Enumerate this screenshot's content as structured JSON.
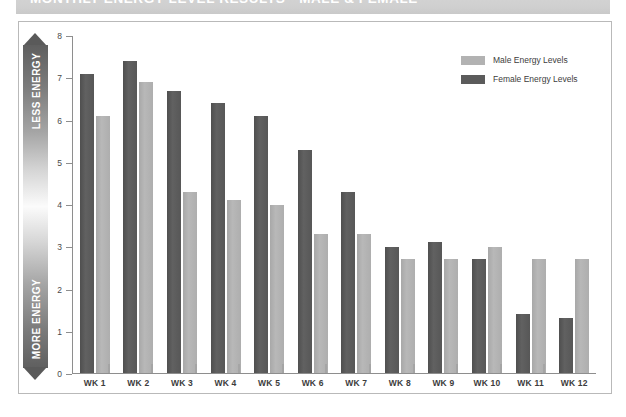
{
  "header": {
    "title": "MONTHLY ENERGY LEVEL RESULTS - MALE & FEMALE"
  },
  "energy_axis": {
    "top_label": "LESS ENERGY",
    "bottom_label": "MORE ENERGY"
  },
  "legend": {
    "items": [
      {
        "label": "Male Energy Levels",
        "color": "#b2b2b2",
        "key": "male"
      },
      {
        "label": "Female Energy Levels",
        "color": "#5b5b5b",
        "key": "female"
      }
    ]
  },
  "y_axis": {
    "ticks": [
      "0",
      "1",
      "2",
      "3",
      "4",
      "5",
      "6",
      "7",
      "8"
    ]
  },
  "chart_data": {
    "type": "bar",
    "title": "MONTHLY ENERGY LEVEL RESULTS - MALE & FEMALE",
    "xlabel": "",
    "ylabel": "",
    "ylim": [
      0,
      8
    ],
    "yticks": [
      0,
      1,
      2,
      3,
      4,
      5,
      6,
      7,
      8
    ],
    "grid": false,
    "legend_position": "top-right",
    "categories": [
      "WK 1",
      "WK 2",
      "WK 3",
      "WK 4",
      "WK 5",
      "WK 6",
      "WK 7",
      "WK 8",
      "WK 9",
      "WK 10",
      "WK 11",
      "WK 12"
    ],
    "series": [
      {
        "name": "Female Energy Levels",
        "color": "#5b5b5b",
        "values": [
          7.1,
          7.4,
          6.7,
          6.4,
          6.1,
          5.3,
          4.3,
          3.0,
          3.1,
          2.7,
          1.4,
          1.3
        ]
      },
      {
        "name": "Male Energy Levels",
        "color": "#b2b2b2",
        "values": [
          6.1,
          6.9,
          4.3,
          4.1,
          4.0,
          3.3,
          3.3,
          2.7,
          2.7,
          3.0,
          2.7,
          2.7
        ]
      }
    ],
    "annotations": [
      "LESS ENERGY",
      "MORE ENERGY"
    ]
  }
}
